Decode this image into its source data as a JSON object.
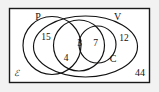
{
  "diagram": {
    "type": "venn-diagram",
    "universe": {
      "symbol": "ℰ",
      "outside_count": "44"
    },
    "sets": [
      {
        "key": "P",
        "label": "P"
      },
      {
        "key": "V",
        "label": "V"
      },
      {
        "key": "C",
        "label": "C"
      }
    ],
    "regions": [
      {
        "key": "p_only",
        "value": "15"
      },
      {
        "key": "p_and_v",
        "value": "4"
      },
      {
        "key": "all",
        "value": "3"
      },
      {
        "key": "v_and_c",
        "value": "7"
      },
      {
        "key": "v_only",
        "value": "12"
      }
    ],
    "colors": {
      "stroke": "#111111",
      "rect_stroke": "#1a1a1a",
      "rect_fill": "#ffffff",
      "page_background": "#f2f2f2"
    }
  }
}
